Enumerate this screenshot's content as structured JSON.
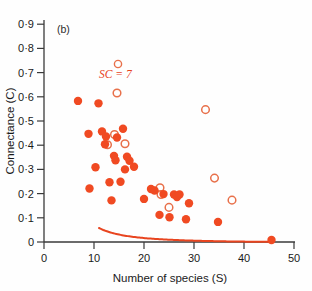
{
  "figure": {
    "panel_label": "(b)",
    "accent_color": "#E8441F",
    "marker_fill_color": "#F04A22",
    "marker_open_color": "#E8704A",
    "axis_color": "#3a3a3a",
    "text_color": "#1a1a1a"
  },
  "annotation": {
    "text": "SC = 7",
    "symbol": "open-circle"
  },
  "chart_data": {
    "type": "scatter",
    "title": "",
    "xlabel": "Number of species (S)",
    "ylabel": "Connectance (C)",
    "xlim": [
      0,
      50
    ],
    "ylim": [
      0,
      0.9
    ],
    "xticks": [
      0,
      10,
      20,
      30,
      40,
      50
    ],
    "yticks": [
      0,
      0.1,
      0.2,
      0.3,
      0.4,
      0.5,
      0.6,
      0.7,
      0.8,
      0.9
    ],
    "xticklabels": [
      "0",
      "10",
      "20",
      "30",
      "40",
      "50"
    ],
    "yticklabels": [
      "0",
      "0·1",
      "0·2",
      "0·3",
      "0·4",
      "0·5",
      "0·6",
      "0·7",
      "0·8",
      "0·9"
    ],
    "grid": false,
    "legend": "none",
    "series": [
      {
        "name": "filled",
        "marker": "filled-circle",
        "points": [
          [
            6.8,
            0.583
          ],
          [
            8.9,
            0.447
          ],
          [
            9.1,
            0.221
          ],
          [
            10.3,
            0.309
          ],
          [
            10.9,
            0.573
          ],
          [
            11.6,
            0.457
          ],
          [
            12.2,
            0.404
          ],
          [
            12.4,
            0.436
          ],
          [
            13.1,
            0.247
          ],
          [
            13.5,
            0.172
          ],
          [
            14.0,
            0.356
          ],
          [
            14.3,
            0.338
          ],
          [
            14.6,
            0.432
          ],
          [
            15.3,
            0.249
          ],
          [
            15.8,
            0.468
          ],
          [
            16.2,
            0.3
          ],
          [
            16.6,
            0.352
          ],
          [
            17.1,
            0.336
          ],
          [
            18.0,
            0.311
          ],
          [
            20.0,
            0.178
          ],
          [
            21.4,
            0.219
          ],
          [
            22.1,
            0.213
          ],
          [
            23.1,
            0.112
          ],
          [
            23.9,
            0.198
          ],
          [
            25.1,
            0.102
          ],
          [
            26.0,
            0.196
          ],
          [
            26.6,
            0.186
          ],
          [
            27.1,
            0.196
          ],
          [
            28.4,
            0.094
          ],
          [
            29.0,
            0.16
          ],
          [
            34.8,
            0.083
          ],
          [
            45.5,
            0.008
          ]
        ]
      },
      {
        "name": "open",
        "marker": "open-circle",
        "points": [
          [
            12.7,
            0.402
          ],
          [
            14.1,
            0.444
          ],
          [
            14.6,
            0.616
          ],
          [
            16.2,
            0.406
          ],
          [
            23.2,
            0.224
          ],
          [
            23.4,
            0.196
          ],
          [
            25.0,
            0.143
          ],
          [
            32.3,
            0.547
          ],
          [
            34.1,
            0.264
          ],
          [
            37.6,
            0.173
          ]
        ]
      }
    ],
    "fit_curve": {
      "name": "SC = 7 hyperbola",
      "equation": "C = 7 / S^2",
      "x_start": 11.0,
      "x_end": 45.5,
      "color": "#E8441F"
    }
  }
}
